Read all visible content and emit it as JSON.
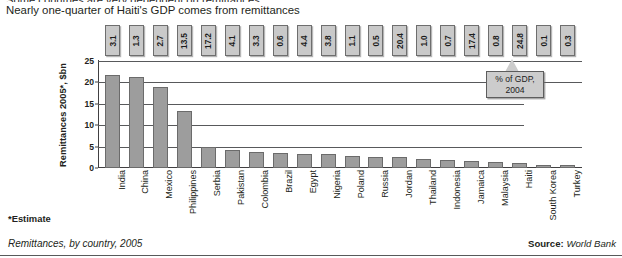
{
  "headline": {
    "line_cut": "Some countries are very dependent on remittances.",
    "line_main": "Nearly one-quarter of Haiti's GDP comes from remittances"
  },
  "callout": {
    "line1": "% of GDP,",
    "line2": "2004"
  },
  "footnotes": {
    "estimate": "*Estimate",
    "caption": "Remittances, by country, 2005",
    "source_label": "Source:",
    "source_value": "World Bank"
  },
  "colors": {
    "bar_fill": "#9d9d9d",
    "bar_stroke": "#6b6b6b",
    "box_fill": "#c9c9c9",
    "callout_fill": "#cccccc",
    "axis": "#414042",
    "grid": "#58595b",
    "text": "#231f20"
  },
  "chart_data": {
    "type": "bar",
    "title": "Nearly one-quarter of Haiti's GDP comes from remittances",
    "subtitle": "Remittances, by country, 2005",
    "xlabel": "",
    "ylabel": "Remittances 2005*, $bn",
    "ylim": [
      0,
      25
    ],
    "yticks": [
      0,
      5,
      10,
      15,
      20,
      25
    ],
    "ytick_labels": [
      "0",
      "5",
      "10",
      "15",
      "20",
      "25"
    ],
    "grid": true,
    "legend": "none",
    "categories": [
      "India",
      "China",
      "Mexico",
      "Philippines",
      "Serbia",
      "Pakistan",
      "Colombia",
      "Brazil",
      "Egypt",
      "Nigeria",
      "Poland",
      "Russia",
      "Jordan",
      "Thailand",
      "Indonesia",
      "Jamaica",
      "Malaysia",
      "Haiti",
      "South Korea",
      "Turkey"
    ],
    "series": [
      {
        "name": "Remittances 2005*, $bn",
        "values": [
          21.7,
          21.3,
          18.9,
          13.4,
          4.9,
          4.3,
          3.7,
          3.6,
          3.3,
          3.2,
          2.9,
          2.6,
          2.5,
          2.0,
          1.9,
          1.6,
          1.3,
          1.1,
          0.8,
          0.7
        ]
      },
      {
        "name": "% of GDP, 2004",
        "values": [
          3.1,
          1.3,
          2.7,
          13.5,
          17.2,
          4.1,
          3.3,
          0.6,
          4.4,
          3.8,
          1.1,
          0.5,
          20.4,
          1.0,
          0.7,
          17.4,
          0.8,
          24.8,
          0.1,
          0.3
        ],
        "display": [
          "3.1",
          "1.3",
          "2.7",
          "13.5",
          "17.2",
          "4.1",
          "3.3",
          "0.6",
          "4.4",
          "3.8",
          "1.1",
          "0.5",
          "20.4",
          "1.0",
          "0.7",
          "17.4",
          "0.8",
          "24.8",
          "0.1",
          "0.3"
        ]
      }
    ],
    "annotations": [
      "% of GDP, 2004",
      "*Estimate",
      "Source: World Bank"
    ]
  }
}
